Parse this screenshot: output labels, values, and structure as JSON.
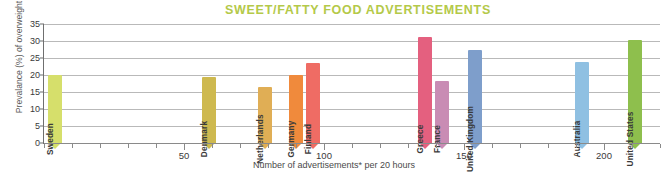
{
  "chart_data": {
    "type": "bar",
    "title": "SWEET/FATTY FOOD ADVERTISEMENTS",
    "xlabel": "Number of advertisements* per 20 hours",
    "ylabel": "Prevalance (%) of overweight",
    "xlim": [
      0,
      220
    ],
    "ylim": [
      0,
      35
    ],
    "grid": true,
    "legend": "none",
    "y_ticks": [
      "0",
      "5",
      "10",
      "15",
      "20",
      "25",
      "30",
      "35"
    ],
    "y_tick_values": [
      0,
      5,
      10,
      15,
      20,
      25,
      30,
      35
    ],
    "x_ticks": [
      "50",
      "100",
      "150",
      "200"
    ],
    "x_tick_values": [
      50,
      100,
      150,
      200
    ],
    "x_minor_step": 10,
    "categories": [
      "Sweden",
      "Denmark",
      "Netherlands",
      "Germany",
      "Finland",
      "Greece",
      "France",
      "United Kingdom",
      "Australia",
      "United States"
    ],
    "points": [
      {
        "label": "Sweden",
        "x": 4,
        "y": 20.0,
        "color": "#d6df6b"
      },
      {
        "label": "Denmark",
        "x": 59,
        "y": 19.4,
        "color": "#ceb94f"
      },
      {
        "label": "Netherlands",
        "x": 79,
        "y": 16.6,
        "color": "#e0ae55"
      },
      {
        "label": "Germany",
        "x": 90,
        "y": 20.0,
        "color": "#f08a3c"
      },
      {
        "label": "Finland",
        "x": 96,
        "y": 23.4,
        "color": "#ef6c64"
      },
      {
        "label": "Greece",
        "x": 136,
        "y": 31.2,
        "color": "#e4607f"
      },
      {
        "label": "France",
        "x": 142,
        "y": 18.1,
        "color": "#c98cb4"
      },
      {
        "label": "United Kingdom",
        "x": 154,
        "y": 27.4,
        "color": "#7e9ecb"
      },
      {
        "label": "Australia",
        "x": 192,
        "y": 23.7,
        "color": "#8fc0e2"
      },
      {
        "label": "United States",
        "x": 211,
        "y": 30.4,
        "color": "#8ebf4d"
      }
    ],
    "title_color": "#b4c949",
    "axis_text_color": "#3a3a3a",
    "grid_color": "#b9b9b9"
  }
}
